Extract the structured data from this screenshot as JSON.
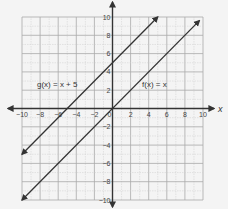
{
  "chart_data": {
    "type": "line",
    "title": "",
    "xlabel": "x",
    "ylabel": "y",
    "xlim": [
      -10,
      10
    ],
    "ylim": [
      -10,
      10
    ],
    "grid": true,
    "grid_minor_step": 1,
    "grid_major_step": 2,
    "x_tick_labels": [
      "−10",
      "−8",
      "−6",
      "−4",
      "−2",
      "0",
      "2",
      "4",
      "6",
      "8",
      "10"
    ],
    "y_tick_labels": [
      "10",
      "8",
      "6",
      "4",
      "2",
      "−2",
      "−4",
      "−6",
      "−8",
      "−10"
    ],
    "series": [
      {
        "name": "g(x) = x + 5",
        "equation": "y = x + 5",
        "x": [
          -10,
          5
        ],
        "y": [
          -5,
          10
        ],
        "arrows": "both",
        "label_position": {
          "x": -8.5,
          "y": 2.8
        }
      },
      {
        "name": "f(x) = x",
        "equation": "y = x",
        "x": [
          -10,
          9.6
        ],
        "y": [
          -10,
          9.6
        ],
        "arrows": "both",
        "label_position": {
          "x": 3.3,
          "y": 2.8
        }
      }
    ],
    "colors": {
      "background": "#f4f4f4",
      "grid_minor": "#cfcfcf",
      "grid_major": "#a9a9a9",
      "axes": "#333333",
      "lines": "#333333"
    }
  },
  "labels": {
    "g": "g(x) = x + 5",
    "f": "f(x) = x",
    "x_axis": "x",
    "y_axis": "y"
  }
}
